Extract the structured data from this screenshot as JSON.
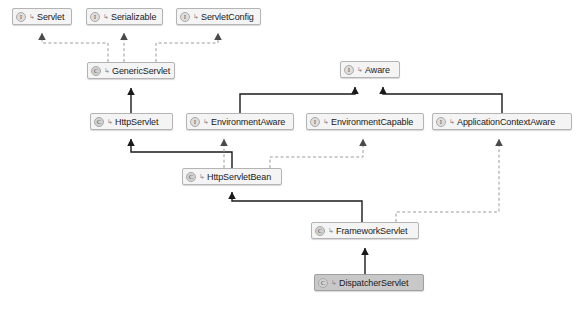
{
  "diagram": {
    "type": "uml-class-diagram",
    "canvas": {
      "width": 576,
      "height": 309,
      "background": "#ffffff"
    },
    "style": {
      "node_fill": "#f4f4f4",
      "node_border": "#b4b4b4",
      "node_selected_fill": "#c8c8c8",
      "edge_solid_color": "#1a1a1a",
      "edge_dashed_color": "#9a9a9a",
      "text_color": "#1a1a1a"
    },
    "icon_glyphs": {
      "interface": "I",
      "class": "C",
      "sub": "↳"
    },
    "nodes": [
      {
        "id": "servlet",
        "label": "Servlet",
        "kind": "interface",
        "icon": "interface-icon",
        "selected": false,
        "x": 12,
        "y": 8,
        "w": 60
      },
      {
        "id": "serializable",
        "label": "Serializable",
        "kind": "interface",
        "icon": "interface-icon",
        "selected": false,
        "x": 86,
        "y": 8,
        "w": 77
      },
      {
        "id": "servletconfig",
        "label": "ServletConfig",
        "kind": "interface",
        "icon": "interface-icon",
        "selected": false,
        "x": 176,
        "y": 8,
        "w": 85
      },
      {
        "id": "genericservlet",
        "label": "GenericServlet",
        "kind": "class",
        "icon": "class-icon",
        "selected": false,
        "x": 87,
        "y": 62,
        "w": 88
      },
      {
        "id": "aware",
        "label": "Aware",
        "kind": "interface",
        "icon": "interface-icon",
        "selected": false,
        "x": 340,
        "y": 61,
        "w": 60
      },
      {
        "id": "httpservlet",
        "label": "HttpServlet",
        "kind": "class",
        "icon": "class-icon",
        "selected": false,
        "x": 90,
        "y": 113,
        "w": 83
      },
      {
        "id": "environmentaware",
        "label": "EnvironmentAware",
        "kind": "interface",
        "icon": "interface-icon",
        "selected": false,
        "x": 186,
        "y": 113,
        "w": 108
      },
      {
        "id": "environmentcapable",
        "label": "EnvironmentCapable",
        "kind": "interface",
        "icon": "interface-icon",
        "selected": false,
        "x": 306,
        "y": 113,
        "w": 118
      },
      {
        "id": "applicationcontextaware",
        "label": "ApplicationContextAware",
        "kind": "interface",
        "icon": "interface-icon",
        "selected": false,
        "x": 432,
        "y": 113,
        "w": 140
      },
      {
        "id": "httpservletbean",
        "label": "HttpServletBean",
        "kind": "class",
        "icon": "class-icon",
        "selected": false,
        "x": 182,
        "y": 168,
        "w": 100
      },
      {
        "id": "frameworkservlet",
        "label": "FrameworkServlet",
        "kind": "class",
        "icon": "class-icon",
        "selected": false,
        "x": 311,
        "y": 222,
        "w": 108
      },
      {
        "id": "dispatcherservlet",
        "label": "DispatcherServlet",
        "kind": "class",
        "icon": "class-icon",
        "selected": true,
        "x": 314,
        "y": 274,
        "w": 110
      }
    ],
    "edges": [
      {
        "id": "e1",
        "from": "genericservlet",
        "to": "servlet",
        "relation": "implements",
        "line": "dashed"
      },
      {
        "id": "e2",
        "from": "genericservlet",
        "to": "serializable",
        "relation": "implements",
        "line": "dashed"
      },
      {
        "id": "e3",
        "from": "genericservlet",
        "to": "servletconfig",
        "relation": "implements",
        "line": "dashed"
      },
      {
        "id": "e4",
        "from": "httpservlet",
        "to": "genericservlet",
        "relation": "extends",
        "line": "solid"
      },
      {
        "id": "e5",
        "from": "environmentaware",
        "to": "aware",
        "relation": "extends",
        "line": "solid"
      },
      {
        "id": "e6",
        "from": "applicationcontextaware",
        "to": "aware",
        "relation": "extends",
        "line": "solid"
      },
      {
        "id": "e7",
        "from": "httpservletbean",
        "to": "httpservlet",
        "relation": "extends",
        "line": "solid"
      },
      {
        "id": "e8",
        "from": "httpservletbean",
        "to": "environmentaware",
        "relation": "implements",
        "line": "dashed"
      },
      {
        "id": "e9",
        "from": "httpservletbean",
        "to": "environmentcapable",
        "relation": "implements",
        "line": "dashed"
      },
      {
        "id": "e10",
        "from": "frameworkservlet",
        "to": "httpservletbean",
        "relation": "extends",
        "line": "solid"
      },
      {
        "id": "e11",
        "from": "frameworkservlet",
        "to": "applicationcontextaware",
        "relation": "implements",
        "line": "dashed"
      },
      {
        "id": "e12",
        "from": "dispatcherservlet",
        "to": "frameworkservlet",
        "relation": "extends",
        "line": "solid"
      }
    ]
  }
}
